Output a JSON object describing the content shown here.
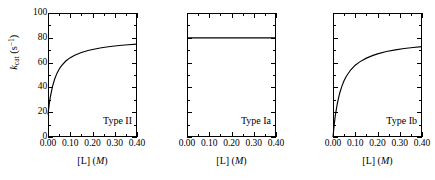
{
  "figure": {
    "background": "#ffffff",
    "ink": "#000000",
    "panel_count": 3
  },
  "axes": {
    "ylabel_k": "k",
    "ylabel_sub": "cat",
    "ylabel_unit_open": " (s",
    "ylabel_unit_sup": "−1",
    "ylabel_unit_close": ")",
    "ylabel_full": "k_cat (s−1)",
    "xlabel_bracket": "[L] (",
    "xlabel_m": "M",
    "xlabel_close": ")",
    "xlabel_full": "[L] (M)",
    "ytick_labels": [
      "0",
      "20",
      "40",
      "60",
      "80",
      "100"
    ],
    "ytick_values": [
      0,
      20,
      40,
      60,
      80,
      100
    ],
    "yminor_values": [
      10,
      30,
      50,
      70,
      90
    ],
    "xtick_labels": [
      "0.00",
      "0.10",
      "0.20",
      "0.30",
      "0.40"
    ],
    "xtick_values": [
      0.0,
      0.1,
      0.2,
      0.3,
      0.4
    ],
    "xminor_values": [
      0.05,
      0.15,
      0.25,
      0.35
    ],
    "xlim": [
      0.0,
      0.4
    ],
    "ylim": [
      0,
      100
    ]
  },
  "chart_data": [
    {
      "type": "line",
      "title": "Type II",
      "panel_label": "Type II",
      "xlabel": "[L] (M)",
      "ylabel": "k_cat (s^-1)",
      "xlim": [
        0.0,
        0.4
      ],
      "ylim": [
        0,
        100
      ],
      "grid": false,
      "legend": "none",
      "annotation": "Type II",
      "model": "k_cat = k0 + (kmax - k0) * [L] / (K + [L]), k0 = 18, kmax = 80, K = 0.035",
      "x": [
        0.0,
        0.005,
        0.01,
        0.02,
        0.03,
        0.04,
        0.05,
        0.06,
        0.08,
        0.1,
        0.12,
        0.15,
        0.18,
        0.2,
        0.24,
        0.28,
        0.32,
        0.36,
        0.4
      ],
      "y": [
        18.0,
        25.8,
        31.8,
        40.7,
        46.8,
        51.3,
        54.7,
        57.4,
        61.3,
        64.0,
        66.0,
        68.2,
        69.8,
        70.6,
        72.0,
        73.0,
        73.8,
        74.4,
        74.9
      ]
    },
    {
      "type": "line",
      "title": "Type Ia",
      "panel_label": "Type Ia",
      "xlabel": "[L] (M)",
      "ylabel": "k_cat (s^-1)",
      "xlim": [
        0.0,
        0.4
      ],
      "ylim": [
        0,
        100
      ],
      "grid": false,
      "legend": "none",
      "annotation": "Type Ia",
      "model": "k_cat = 80 (constant, independent of [L])",
      "x": [
        0.0,
        0.05,
        0.1,
        0.15,
        0.2,
        0.25,
        0.3,
        0.35,
        0.4
      ],
      "y": [
        80,
        80,
        80,
        80,
        80,
        80,
        80,
        80,
        80
      ]
    },
    {
      "type": "line",
      "title": "Type Ib",
      "panel_label": "Type Ib",
      "xlabel": "[L] (M)",
      "ylabel": "k_cat (s^-1)",
      "xlim": [
        0.0,
        0.4
      ],
      "ylim": [
        0,
        100
      ],
      "grid": false,
      "legend": "none",
      "annotation": "Type Ib",
      "model": "k_cat = kmax * [L] / (K + [L]), kmax = 80, K = 0.038",
      "x": [
        0.0,
        0.005,
        0.01,
        0.02,
        0.03,
        0.04,
        0.05,
        0.06,
        0.08,
        0.1,
        0.12,
        0.15,
        0.18,
        0.2,
        0.24,
        0.28,
        0.32,
        0.36,
        0.4
      ],
      "y": [
        0.0,
        9.3,
        16.8,
        27.6,
        35.3,
        41.0,
        45.5,
        49.0,
        54.2,
        57.9,
        60.6,
        63.6,
        65.8,
        67.0,
        68.9,
        70.3,
        71.4,
        72.2,
        72.9
      ]
    }
  ]
}
